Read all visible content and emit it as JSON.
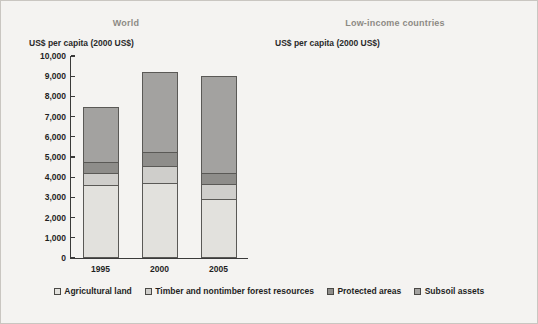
{
  "figure": {
    "background": "#f4f3f1"
  },
  "legend": {
    "items": [
      {
        "label": "Agricultural land",
        "color": "#e2e1dd",
        "key": "agricultural_land"
      },
      {
        "label": "Timber and nontimber forest resources",
        "color": "#cfcecb",
        "key": "timber_forest"
      },
      {
        "label": "Protected areas",
        "color": "#8e8d8a",
        "key": "protected_areas"
      },
      {
        "label": "Subsoil assets",
        "color": "#a3a2a0",
        "key": "subsoil_assets"
      }
    ]
  },
  "panels": [
    {
      "id": "world",
      "title": "World",
      "axis_label": "US$ per capita (2000 US$)",
      "yticks": [
        "10,000",
        "9,000",
        "8,000",
        "7,000",
        "6,000",
        "5,000",
        "4,000",
        "3,000",
        "2,000",
        "1,000",
        "0"
      ],
      "xticks": [
        "1995",
        "2000",
        "2005"
      ]
    },
    {
      "id": "low_income",
      "title": "Low-income countries",
      "axis_label": "US$ per capita (2000 US$)",
      "yticks": [
        "4,000",
        "3,500",
        "3,000",
        "2,500",
        "2,000",
        "1,500",
        "1,000",
        "500",
        "0"
      ],
      "xticks": [
        "1995",
        "2000",
        "2005"
      ]
    }
  ],
  "chart_data": [
    {
      "type": "bar",
      "stacked": true,
      "title": "World",
      "xlabel": "",
      "ylabel": "US$ per capita (2000 US$)",
      "ylim": [
        0,
        10000
      ],
      "ytick_step": 1000,
      "grid": false,
      "legend_position": "bottom",
      "categories": [
        "1995",
        "2000",
        "2005"
      ],
      "series": [
        {
          "name": "Agricultural land",
          "color": "#e2e1dd",
          "values": [
            3620,
            3720,
            2930
          ]
        },
        {
          "name": "Timber and nontimber forest resources",
          "color": "#cfcecb",
          "values": [
            600,
            830,
            720
          ]
        },
        {
          "name": "Protected areas",
          "color": "#8e8d8a",
          "values": [
            520,
            720,
            560
          ]
        },
        {
          "name": "Subsoil assets",
          "color": "#a3a2a0",
          "values": [
            2760,
            3930,
            4790
          ]
        }
      ],
      "totals": [
        7500,
        9200,
        9000
      ]
    },
    {
      "type": "bar",
      "stacked": true,
      "title": "Low-income countries",
      "xlabel": "",
      "ylabel": "US$ per capita (2000 US$)",
      "ylim": [
        0,
        4000
      ],
      "ytick_step": 500,
      "grid": false,
      "legend_position": "bottom",
      "categories": [
        "1995",
        "2000",
        "2005"
      ],
      "series": [
        {
          "name": "Agricultural land",
          "color": "#e2e1dd",
          "values": [
            2570,
            2320,
            1770
          ]
        },
        {
          "name": "Timber and nontimber forest resources",
          "color": "#cfcecb",
          "values": [
            240,
            280,
            360
          ]
        },
        {
          "name": "Protected areas",
          "color": "#8e8d8a",
          "values": [
            190,
            190,
            100
          ]
        },
        {
          "name": "Subsoil assets",
          "color": "#a3a2a0",
          "values": [
            380,
            610,
            830
          ]
        }
      ],
      "totals": [
        3380,
        3400,
        3060
      ]
    }
  ]
}
